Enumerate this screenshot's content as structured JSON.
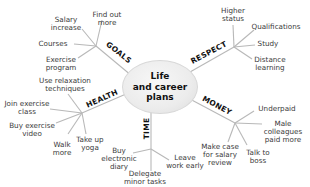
{
  "diagram": {
    "type": "mind-map",
    "center": {
      "label": "Life\nand career\nplans"
    },
    "branches": [
      {
        "name": "GOALS",
        "label": "GOALS",
        "leaves": [
          "Salary\nincrease",
          "Find out\nmore",
          "Courses",
          "Exercise\nprogram"
        ]
      },
      {
        "name": "RESPECT",
        "label": "RESPECT",
        "leaves": [
          "Higher\nstatus",
          "Qualifications",
          "Study",
          "Distance\nlearning"
        ]
      },
      {
        "name": "HEALTH",
        "label": "HEALTH",
        "leaves": [
          "Use relaxation\ntechniques",
          "Join exercise\nclass",
          "Buy exercise\nvideo",
          "Walk\nmore",
          "Take up\nyoga"
        ]
      },
      {
        "name": "TIME",
        "label": "TIME",
        "leaves": [
          "Buy\nelectronic\ndiary",
          "Delegate\nminor tasks",
          "Leave\nwork early"
        ]
      },
      {
        "name": "MONEY",
        "label": "MONEY",
        "leaves": [
          "Underpaid",
          "Male\ncolleagues\npaid more",
          "Make case\nfor salary\nreview",
          "Talk to\nboss"
        ]
      }
    ]
  },
  "colors": {
    "line": "#b8b8b8",
    "text": "#3a3a3a",
    "branch_text": "#111111",
    "center_fill": "#ececec"
  }
}
